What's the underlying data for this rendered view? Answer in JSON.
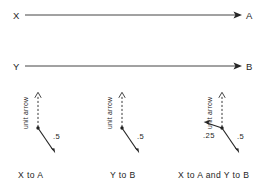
{
  "figure": {
    "background_color": "#ffffff",
    "ink_color": "#262626",
    "paths": [
      {
        "id": "path-x-a",
        "source_label": "X",
        "target_label": "A",
        "arrow_style": "solid-filled-head"
      },
      {
        "id": "path-y-b",
        "source_label": "Y",
        "target_label": "B",
        "arrow_style": "solid-filled-head"
      }
    ],
    "diagrams": [
      {
        "id": "diagram-x-to-a",
        "caption": "X to A",
        "unit_arrow_label": "unit arrow",
        "unit_arrow_style": "dashed-open-head",
        "vectors": [
          {
            "id": "vector-down-right",
            "magnitude_label": ".5",
            "direction": "down-right"
          }
        ]
      },
      {
        "id": "diagram-y-to-b",
        "caption": "Y to B",
        "unit_arrow_label": "unit arrow",
        "unit_arrow_style": "dashed-open-head",
        "vectors": [
          {
            "id": "vector-down-right",
            "magnitude_label": ".5",
            "direction": "down-right"
          }
        ]
      },
      {
        "id": "diagram-x-to-a-and-y-to-b",
        "caption": "X to A and Y to B",
        "unit_arrow_label": "unit arrow",
        "unit_arrow_style": "dashed-open-head",
        "vectors": [
          {
            "id": "vector-up-left",
            "magnitude_label": ".25",
            "direction": "up-left"
          },
          {
            "id": "vector-down-right",
            "magnitude_label": ".5",
            "direction": "down-right"
          }
        ]
      }
    ]
  }
}
